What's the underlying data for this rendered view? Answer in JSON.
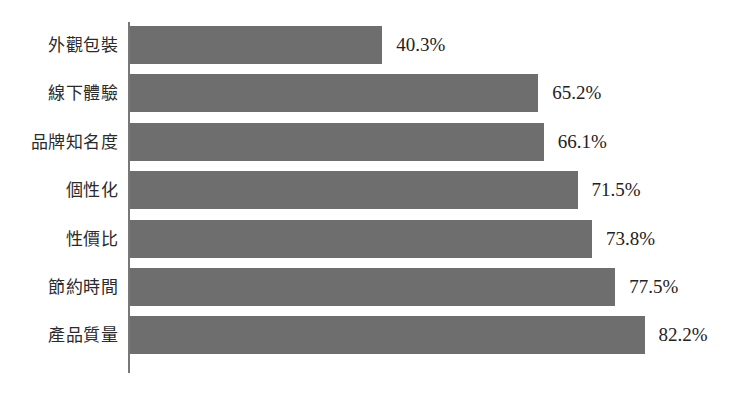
{
  "chart_data": {
    "type": "bar",
    "orientation": "horizontal",
    "title": "",
    "subtitle": "",
    "xlabel": "",
    "ylabel": "",
    "xlim": [
      0,
      82.2
    ],
    "grid": false,
    "legend": null,
    "axis_visible": {
      "y_axis_line": true,
      "x_axis_line": false,
      "ticks": false
    },
    "value_label_suffix": "%",
    "categories": [
      "外觀包裝",
      "線下體驗",
      "品牌知名度",
      "個性化",
      "性價比",
      "節約時間",
      "產品質量"
    ],
    "values": [
      40.3,
      65.2,
      66.1,
      71.5,
      73.8,
      77.5,
      82.2
    ],
    "value_labels": [
      "40.3%",
      "65.2%",
      "66.1%",
      "71.5%",
      "73.8%",
      "77.5%",
      "82.2%"
    ],
    "series": [
      {
        "name": "",
        "values": [
          40.3,
          65.2,
          66.1,
          71.5,
          73.8,
          77.5,
          82.2
        ]
      }
    ],
    "points": [
      {
        "category": "外觀包裝",
        "value": 40.3,
        "label": "40.3%"
      },
      {
        "category": "線下體驗",
        "value": 65.2,
        "label": "65.2%"
      },
      {
        "category": "品牌知名度",
        "value": 66.1,
        "label": "66.1%"
      },
      {
        "category": "個性化",
        "value": 71.5,
        "label": "71.5%"
      },
      {
        "category": "性價比",
        "value": 73.8,
        "label": "73.8%"
      },
      {
        "category": "節約時間",
        "value": 77.5,
        "label": "77.5%"
      },
      {
        "category": "產品質量",
        "value": 82.2,
        "label": "82.2%"
      }
    ],
    "colors": {
      "bar": "#6e6e6e",
      "axis": "#777777",
      "background": "#ffffff",
      "label_text": "#2b2b2b",
      "value_text": "#222222"
    }
  }
}
